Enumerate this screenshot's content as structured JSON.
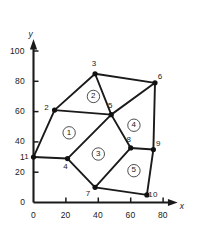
{
  "figure": {
    "title": "",
    "background_color": "#ffffff",
    "ink_color": "#1a1a1a",
    "width": 197,
    "height": 228
  },
  "axes": {
    "x_axis_label": "x",
    "y_axis_label": "y",
    "x_ticks": [
      "0",
      "20",
      "40",
      "60",
      "80"
    ],
    "y_ticks": [
      "0",
      "20",
      "1",
      "40",
      "60",
      "80",
      "100"
    ],
    "x_range": [
      0,
      88
    ],
    "y_range": [
      0,
      108
    ],
    "origin_label": "0"
  },
  "chart_data": {
    "type": "scatter",
    "title": "",
    "xlabel": "x",
    "ylabel": "y",
    "xlim": [
      0,
      88
    ],
    "ylim": [
      0,
      108
    ],
    "grid": false,
    "legend": "none",
    "x_ticks": [
      0,
      20,
      40,
      60,
      80
    ],
    "y_ticks": [
      0,
      20,
      40,
      60,
      80,
      100
    ],
    "nodes": [
      {
        "id": "1",
        "x": 0,
        "y": 30,
        "label_dx": -7,
        "label_dy": 0
      },
      {
        "id": "2",
        "x": 13,
        "y": 61,
        "label_dx": -8,
        "label_dy": -2
      },
      {
        "id": "3",
        "x": 38,
        "y": 85,
        "label_dx": -1,
        "label_dy": -9
      },
      {
        "id": "4",
        "x": 21,
        "y": 29,
        "label_dx": -2,
        "label_dy": 9
      },
      {
        "id": "5",
        "x": 48,
        "y": 58,
        "label_dx": -1,
        "label_dy": -8
      },
      {
        "id": "6",
        "x": 75,
        "y": 79,
        "label_dx": 5,
        "label_dy": -5
      },
      {
        "id": "7",
        "x": 38,
        "y": 10,
        "label_dx": -7,
        "label_dy": 7
      },
      {
        "id": "8",
        "x": 60,
        "y": 36,
        "label_dx": -2,
        "label_dy": -7
      },
      {
        "id": "9",
        "x": 74,
        "y": 35,
        "label_dx": 5,
        "label_dy": -5
      },
      {
        "id": "10",
        "x": 70,
        "y": 5,
        "label_dx": 6,
        "label_dy": 1
      }
    ],
    "edges": [
      [
        "1",
        "2"
      ],
      [
        "2",
        "3"
      ],
      [
        "3",
        "6"
      ],
      [
        "2",
        "5"
      ],
      [
        "5",
        "3"
      ],
      [
        "1",
        "4"
      ],
      [
        "4",
        "5"
      ],
      [
        "4",
        "7"
      ],
      [
        "7",
        "8"
      ],
      [
        "5",
        "8"
      ],
      [
        "5",
        "6"
      ],
      [
        "6",
        "9"
      ],
      [
        "8",
        "9"
      ],
      [
        "9",
        "10"
      ],
      [
        "7",
        "10"
      ]
    ],
    "elements": [
      {
        "id": "1",
        "label": "1",
        "cx": 22,
        "cy": 46,
        "nodes": [
          "1",
          "2",
          "5",
          "4"
        ]
      },
      {
        "id": "2",
        "label": "2",
        "cx": 37,
        "cy": 70,
        "nodes": [
          "2",
          "3",
          "6",
          "5"
        ]
      },
      {
        "id": "3",
        "label": "3",
        "cx": 40,
        "cy": 32,
        "nodes": [
          "4",
          "5",
          "8",
          "7"
        ]
      },
      {
        "id": "4",
        "label": "4",
        "cx": 62,
        "cy": 51,
        "nodes": [
          "5",
          "6",
          "9",
          "8"
        ]
      },
      {
        "id": "5",
        "label": "5",
        "cx": 62,
        "cy": 21,
        "nodes": [
          "8",
          "9",
          "10",
          "7"
        ]
      }
    ]
  }
}
